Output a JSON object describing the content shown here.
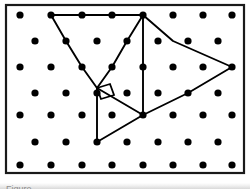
{
  "document": {
    "kind": "geometry-worksheet-figure",
    "caption_sliver_text": "Figure",
    "background_color": "#ffffff",
    "ink_color": "#000000",
    "frame_color": "#1a1a1a",
    "gutter_color": "#8e8e8e"
  },
  "frame": {
    "x": 6,
    "y": 5,
    "width": 238,
    "height": 168,
    "stroke_width": 2.2
  },
  "lattice": {
    "description": "staggered triangular dot lattice",
    "dot_color": "#000000",
    "dot_radius": 3.6,
    "column_pitch": 30.5,
    "row_pitch": 25.5,
    "row_count": 7,
    "rows": [
      {
        "index": 0,
        "y": 15,
        "offset": "aligned",
        "x_values": [
          20,
          51,
          82,
          112,
          143,
          173,
          203,
          232
        ]
      },
      {
        "index": 1,
        "y": 41,
        "offset": "half",
        "x_values": [
          35,
          66,
          97,
          127,
          158,
          188,
          218
        ]
      },
      {
        "index": 2,
        "y": 67,
        "offset": "aligned",
        "x_values": [
          20,
          51,
          82,
          112,
          143,
          173,
          203,
          232
        ]
      },
      {
        "index": 3,
        "y": 93,
        "offset": "half",
        "x_values": [
          35,
          66,
          97,
          127,
          158,
          188,
          218
        ]
      },
      {
        "index": 4,
        "y": 115,
        "offset": "aligned",
        "x_values": [
          20,
          51,
          82,
          112,
          143,
          173,
          203,
          232
        ]
      },
      {
        "index": 5,
        "y": 142,
        "offset": "half",
        "x_values": [
          35,
          66,
          97,
          127,
          158,
          188,
          218
        ]
      },
      {
        "index": 6,
        "y": 165,
        "offset": "aligned",
        "x_values": [
          20,
          51,
          82,
          112,
          143,
          173,
          203,
          232
        ]
      }
    ]
  },
  "figure": {
    "stroke_color": "#000000",
    "stroke_width": 1.9,
    "vertices": {
      "top_left": {
        "x": 51,
        "y": 15
      },
      "top_mid_a": {
        "x": 82,
        "y": 15
      },
      "top_mid_b": {
        "x": 112,
        "y": 15
      },
      "top_hub": {
        "x": 143,
        "y": 15
      },
      "left_mid_upper": {
        "x": 66,
        "y": 41
      },
      "left_mid_lower": {
        "x": 82,
        "y": 67
      },
      "right_angle_pt": {
        "x": 97,
        "y": 88
      },
      "inner_diag_a": {
        "x": 127,
        "y": 41
      },
      "inner_diag_b": {
        "x": 112,
        "y": 67
      },
      "center_hub": {
        "x": 143,
        "y": 115
      },
      "right_upper": {
        "x": 173,
        "y": 41
      },
      "right_apex": {
        "x": 232,
        "y": 67
      },
      "right_lower": {
        "x": 188,
        "y": 93
      },
      "bottom_left": {
        "x": 97,
        "y": 142
      }
    },
    "segments": [
      {
        "name": "top-edge",
        "points": "51,15 82,15 112,15 143,15"
      },
      {
        "name": "left-outer-diagonal",
        "points": "51,15 66,41 82,67 97,88"
      },
      {
        "name": "hub-to-right-angle",
        "points": "143,15 127,41 112,67 97,88"
      },
      {
        "name": "hub-vertical",
        "points": "143,15 143,115"
      },
      {
        "name": "hub-to-apex",
        "points": "143,15 173,41 232,67"
      },
      {
        "name": "apex-to-center-hub",
        "points": "232,67 188,93 143,115"
      },
      {
        "name": "right-angle-vertical",
        "points": "97,88 97,142"
      },
      {
        "name": "right-angle-to-center",
        "points": "97,88 143,115"
      },
      {
        "name": "bottom-left-to-center",
        "points": "97,142 143,115"
      }
    ],
    "right_angle_marker": {
      "name": "right-angle-square",
      "points": "97,88 110,84 114,95 101,99",
      "stroke_width": 1.8
    }
  }
}
